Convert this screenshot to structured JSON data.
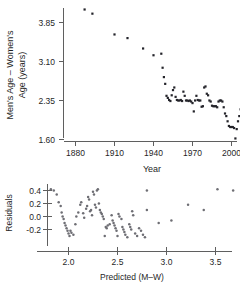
{
  "figure": {
    "panels": [
      {
        "name": "scatter-age-difference-vs-year",
        "axis_x_label": "Year",
        "axis_y_label_line1": "Men's Age – Women's",
        "axis_y_label_line2": "Age (years)"
      },
      {
        "name": "residual-plot",
        "axis_x_label": "Predicted (M–W)",
        "axis_y_label": "Residuals"
      }
    ]
  },
  "chart_data": [
    {
      "type": "scatter",
      "name": "age-difference-vs-year",
      "title": "",
      "xlabel": "Year",
      "ylabel": "Men's Age – Women's Age (years)",
      "xticks": [
        1880,
        1910,
        1940,
        1970,
        2000
      ],
      "xticklabels": [
        "1880",
        "1910",
        "1940",
        "1970",
        "2000"
      ],
      "yticks": [
        3.85,
        3.1,
        2.35,
        1.6
      ],
      "yticklabels": [
        "3.85",
        "3.10",
        "2.35",
        "1.60"
      ],
      "xlim": [
        1868,
        2018
      ],
      "ylim": [
        1.48,
        4.25
      ],
      "grid": false,
      "legend": "none",
      "marker": "square",
      "marker_color": "#24242a",
      "points": [
        [
          1887,
          4.1
        ],
        [
          1893,
          4.02
        ],
        [
          1910,
          3.62
        ],
        [
          1920,
          3.55
        ],
        [
          1932,
          3.35
        ],
        [
          1940,
          3.22
        ],
        [
          1946,
          3.25
        ],
        [
          1947,
          2.98
        ],
        [
          1948,
          2.8
        ],
        [
          1949,
          2.67
        ],
        [
          1950,
          2.44
        ],
        [
          1951,
          2.4
        ],
        [
          1952,
          2.36
        ],
        [
          1953,
          2.34
        ],
        [
          1954,
          2.45
        ],
        [
          1955,
          2.55
        ],
        [
          1956,
          2.6
        ],
        [
          1957,
          2.42
        ],
        [
          1958,
          2.36
        ],
        [
          1959,
          2.35
        ],
        [
          1960,
          2.35
        ],
        [
          1961,
          2.36
        ],
        [
          1962,
          2.34
        ],
        [
          1963,
          2.52
        ],
        [
          1964,
          2.44
        ],
        [
          1965,
          2.35
        ],
        [
          1966,
          2.35
        ],
        [
          1967,
          2.34
        ],
        [
          1968,
          2.35
        ],
        [
          1969,
          2.33
        ],
        [
          1970,
          2.3
        ],
        [
          1971,
          2.14
        ],
        [
          1972,
          2.35
        ],
        [
          1973,
          2.44
        ],
        [
          1974,
          2.36
        ],
        [
          1975,
          2.35
        ],
        [
          1976,
          2.35
        ],
        [
          1977,
          2.23
        ],
        [
          1978,
          2.24
        ],
        [
          1979,
          2.6
        ],
        [
          1980,
          2.62
        ],
        [
          1981,
          2.48
        ],
        [
          1982,
          2.45
        ],
        [
          1983,
          2.35
        ],
        [
          1984,
          2.33
        ],
        [
          1985,
          2.25
        ],
        [
          1986,
          2.24
        ],
        [
          1987,
          2.24
        ],
        [
          1988,
          2.24
        ],
        [
          1989,
          2.22
        ],
        [
          1990,
          2.33
        ],
        [
          1991,
          2.35
        ],
        [
          1992,
          2.35
        ],
        [
          1993,
          2.33
        ],
        [
          1994,
          2.22
        ],
        [
          1995,
          2.1
        ],
        [
          1996,
          2.05
        ],
        [
          1997,
          1.95
        ],
        [
          1998,
          1.86
        ],
        [
          1999,
          1.84
        ],
        [
          2000,
          1.84
        ],
        [
          2001,
          1.84
        ],
        [
          2002,
          1.82
        ],
        [
          2003,
          1.62
        ],
        [
          2004,
          1.8
        ],
        [
          2005,
          1.95
        ],
        [
          2006,
          2.05
        ],
        [
          2007,
          2.18
        ],
        [
          2008,
          2.22
        ],
        [
          2009,
          2.2
        ],
        [
          2010,
          2.22
        ]
      ]
    },
    {
      "type": "scatter",
      "name": "residuals-vs-predicted",
      "title": "",
      "xlabel": "Predicted (M–W)",
      "ylabel": "Residuals",
      "xticks": [
        2.0,
        2.5,
        3.0,
        3.5
      ],
      "xticklabels": [
        "2.0",
        "2.5",
        "3.0",
        "3.5"
      ],
      "yticks": [
        0.4,
        0.2,
        0.0,
        -0.2
      ],
      "yticklabels": [
        "0.4",
        "0.2",
        "0.0",
        "-0.2"
      ],
      "xlim": [
        1.78,
        3.75
      ],
      "ylim": [
        -0.42,
        0.52
      ],
      "grid": false,
      "legend": "none",
      "marker": "circle",
      "marker_color": "#6e6e74",
      "points": [
        [
          1.82,
          0.42
        ],
        [
          1.85,
          0.4
        ],
        [
          1.88,
          0.34
        ],
        [
          1.9,
          0.22
        ],
        [
          1.92,
          0.16
        ],
        [
          1.93,
          0.06
        ],
        [
          1.94,
          0.0
        ],
        [
          1.95,
          -0.04
        ],
        [
          1.96,
          -0.1
        ],
        [
          1.97,
          -0.14
        ],
        [
          1.98,
          -0.18
        ],
        [
          1.99,
          -0.22
        ],
        [
          2.0,
          -0.26
        ],
        [
          2.01,
          -0.3
        ],
        [
          2.02,
          -0.22
        ],
        [
          2.03,
          -0.25
        ],
        [
          2.05,
          -0.28
        ],
        [
          2.07,
          -0.12
        ],
        [
          2.08,
          0.0
        ],
        [
          2.1,
          0.06
        ],
        [
          2.12,
          0.18
        ],
        [
          2.13,
          0.22
        ],
        [
          2.15,
          0.05
        ],
        [
          2.16,
          -0.02
        ],
        [
          2.18,
          0.12
        ],
        [
          2.19,
          0.16
        ],
        [
          2.2,
          0.3
        ],
        [
          2.21,
          0.26
        ],
        [
          2.22,
          0.08
        ],
        [
          2.23,
          0.1
        ],
        [
          2.24,
          0.02
        ],
        [
          2.25,
          0.38
        ],
        [
          2.26,
          0.34
        ],
        [
          2.27,
          0.18
        ],
        [
          2.28,
          0.14
        ],
        [
          2.29,
          0.4
        ],
        [
          2.3,
          0.42
        ],
        [
          2.31,
          0.2
        ],
        [
          2.32,
          0.1
        ],
        [
          2.33,
          0.06
        ],
        [
          2.34,
          0.04
        ],
        [
          2.35,
          0.0
        ],
        [
          2.36,
          -0.04
        ],
        [
          2.37,
          -0.3
        ],
        [
          2.38,
          -0.16
        ],
        [
          2.39,
          -0.18
        ],
        [
          2.4,
          -0.14
        ],
        [
          2.42,
          -0.12
        ],
        [
          2.44,
          0.02
        ],
        [
          2.45,
          -0.06
        ],
        [
          2.46,
          -0.1
        ],
        [
          2.47,
          -0.14
        ],
        [
          2.48,
          -0.18
        ],
        [
          2.49,
          -0.22
        ],
        [
          2.5,
          -0.3
        ],
        [
          2.51,
          0.04
        ],
        [
          2.52,
          0.0
        ],
        [
          2.54,
          -0.04
        ],
        [
          2.55,
          -0.16
        ],
        [
          2.56,
          -0.2
        ],
        [
          2.57,
          -0.24
        ],
        [
          2.58,
          -0.28
        ],
        [
          2.6,
          -0.32
        ],
        [
          2.62,
          -0.12
        ],
        [
          2.63,
          -0.16
        ],
        [
          2.64,
          -0.2
        ],
        [
          2.65,
          0.08
        ],
        [
          2.66,
          0.02
        ],
        [
          2.68,
          -0.26
        ],
        [
          2.7,
          -0.3
        ],
        [
          2.72,
          -0.18
        ],
        [
          2.74,
          -0.22
        ],
        [
          2.76,
          -0.28
        ],
        [
          2.78,
          -0.32
        ],
        [
          2.8,
          0.4
        ],
        [
          2.8,
          0.1
        ],
        [
          2.92,
          -0.1
        ],
        [
          3.05,
          -0.06
        ],
        [
          3.22,
          0.18
        ],
        [
          3.38,
          0.1
        ],
        [
          3.52,
          0.42
        ],
        [
          3.68,
          0.4
        ]
      ]
    }
  ]
}
